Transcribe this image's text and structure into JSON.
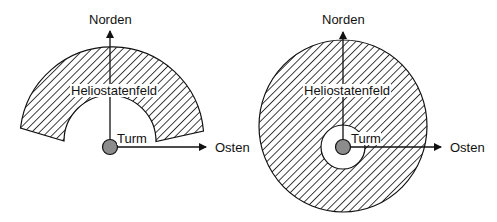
{
  "diagrams": [
    {
      "id": "left",
      "layout": "annular-sector (north field)",
      "labels": {
        "north": "Norden",
        "east": "Osten",
        "field": "Heliostatenfeld",
        "tower": "Turm"
      }
    },
    {
      "id": "right",
      "layout": "full ring (surround field)",
      "labels": {
        "north": "Norden",
        "east": "Osten",
        "field": "Heliostatenfeld",
        "tower": "Turm"
      }
    }
  ],
  "colors": {
    "line": "#111111",
    "tower_fill": "#8c8c8c",
    "background": "#ffffff"
  }
}
